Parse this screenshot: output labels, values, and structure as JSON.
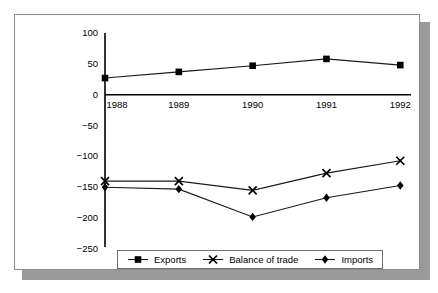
{
  "chart_data": {
    "type": "line",
    "title": "",
    "subtitle": "",
    "xlabel": "",
    "ylabel": "",
    "categories": [
      "1988",
      "1989",
      "1990",
      "1991",
      "1992"
    ],
    "x_tick_labels": [
      "1988",
      "1989",
      "1990",
      "1991",
      "1992"
    ],
    "y_tick_labels": [
      "100",
      "50",
      "0",
      "−50",
      "−100",
      "−150",
      "−200",
      "−250"
    ],
    "y_ticks": [
      100,
      50,
      0,
      -50,
      -100,
      -150,
      -200,
      -250
    ],
    "ylim": [
      -250,
      100
    ],
    "grid": false,
    "legend_position": "bottom",
    "series": [
      {
        "name": "Exports",
        "marker": "square",
        "values": [
          27,
          37,
          47,
          58,
          48
        ]
      },
      {
        "name": "Balance of trade",
        "marker": "x",
        "values": [
          -140,
          -140,
          -155,
          -127,
          -107
        ]
      },
      {
        "name": "Imports",
        "marker": "diamond",
        "values": [
          -150,
          -153,
          -198,
          -167,
          -147
        ]
      }
    ]
  },
  "legend": {
    "entries": [
      {
        "label": "Exports",
        "marker": "square-marker-icon"
      },
      {
        "label": "Balance of trade",
        "marker": "x-marker-icon"
      },
      {
        "label": "Imports",
        "marker": "diamond-marker-icon"
      }
    ]
  },
  "colors": {
    "line": "#1a1a1a",
    "marker": "#000000",
    "axis": "#000000",
    "panel_border": "#8c8c8c",
    "shadow": "#9a9a9a",
    "background": "#ffffff"
  }
}
